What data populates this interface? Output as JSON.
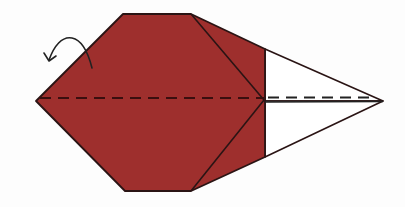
{
  "diagram": {
    "type": "origami-fold-step",
    "colors": {
      "paper_colored": "#9e2f2d",
      "paper_white": "#ffffff",
      "outline": "#2a1414",
      "crease_dash_on_color": "#3a0f0f",
      "crease_dash_on_white": "#222222",
      "arrow": "#222222",
      "background": "#fdfdfd"
    },
    "shapes": {
      "colored_body": "36,101 123,14 191,14 265,49 265,157 191,191 125,191",
      "white_flap_top": "265,49 383,101 265,101",
      "white_flap_bottom": "265,101 383,101 265,157",
      "inner_fold_top": "191,14 264,100",
      "inner_fold_bottom": "191,191 264,100",
      "valley_fold_line": "36,98 383,98",
      "center_solid_line": "265,102 383,102"
    },
    "arrow": {
      "meaning": "fold-behind (mountain fold) arrow",
      "path": "M92,68 C88,52 82,40 72,38 C62,36 54,46 49,60"
    }
  }
}
